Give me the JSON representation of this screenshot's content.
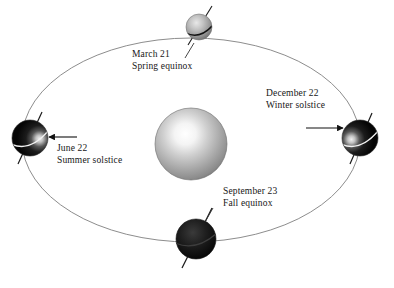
{
  "figure": {
    "background_color": "#ffffff",
    "orbit_color": "#8d8d8d",
    "axis_color": "#1a1a1a",
    "arrow_color": "#111111",
    "text_color": "#161616"
  },
  "sun": {
    "name": "Sun",
    "cx": 191,
    "cy": 144,
    "r": 36,
    "highlight_color": "#ffffff",
    "mid_color": "#b9b9b9",
    "edge_color": "#6f6f6f"
  },
  "orbit": {
    "cx": 191,
    "cy": 140,
    "rx": 169,
    "ry": 102
  },
  "positions": [
    {
      "key": "march",
      "date": "March 21",
      "event": "Spring equinox",
      "cx": 199,
      "cy": 27,
      "r": 13,
      "label_x": 132,
      "label_y": 49,
      "body_shade": "light"
    },
    {
      "key": "december",
      "date": "December 22",
      "event": "Winter solstice",
      "cx": 360,
      "cy": 138,
      "r": 18,
      "label_x": 266,
      "label_y": 88,
      "body_shade": "dark-lit-left"
    },
    {
      "key": "september",
      "date": "September 23",
      "event": "Fall equinox",
      "cx": 196,
      "cy": 239,
      "r": 20,
      "label_x": 223,
      "label_y": 186,
      "body_shade": "dark"
    },
    {
      "key": "june",
      "date": "June 22",
      "event": "Summer solstice",
      "cx": 30,
      "cy": 138,
      "r": 18,
      "label_x": 57,
      "label_y": 143,
      "body_shade": "dark-lit-right"
    }
  ],
  "sunbeams": [
    {
      "key": "beam-to-june",
      "label": "sunlight arrow pointing to June Earth"
    },
    {
      "key": "beam-to-december",
      "label": "sunlight arrow pointing to December Earth"
    }
  ]
}
